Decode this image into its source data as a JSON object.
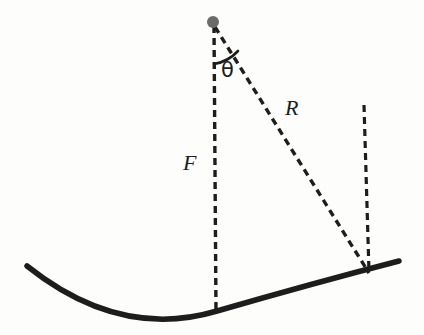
{
  "diagram": {
    "background_color": "#fdfdfc",
    "stroke_color": "#1d1d1d",
    "focus_dot_color": "#5f5f5f",
    "labels": {
      "focal_length": "F",
      "ray_length": "R",
      "angle": "θ"
    },
    "elements": {
      "reflector_curve_name": "parabolic-reflector-curve",
      "focus_point_name": "focus-point-dot",
      "axis_line_name": "focal-axis-dashed-line",
      "ray_line_name": "radius-ray-dashed-line",
      "edge_line_name": "rim-vertical-dashed-line",
      "angle_arc_name": "angle-arc"
    },
    "geometry": {
      "focus": [
        213,
        22
      ],
      "vertex": [
        216,
        311
      ],
      "rim_point": [
        368,
        272
      ],
      "rim_line_top": [
        364,
        105
      ],
      "curve_left_end": [
        27,
        266
      ],
      "curve_right_end": [
        399,
        261
      ]
    }
  }
}
